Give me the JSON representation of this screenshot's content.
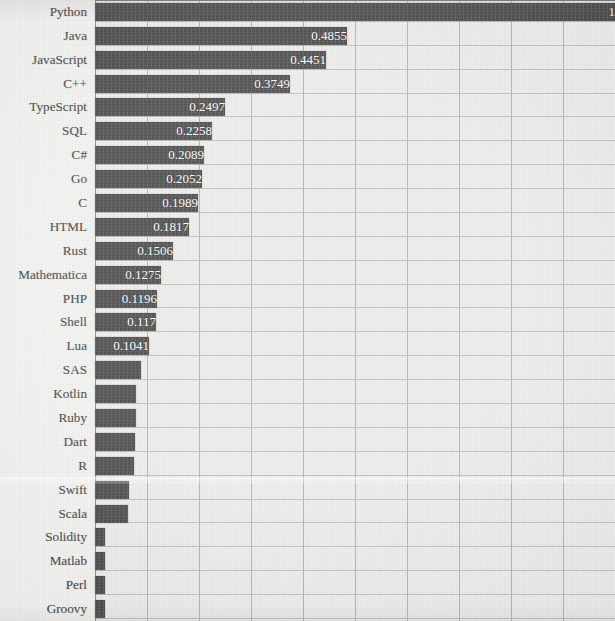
{
  "chart_data": {
    "type": "bar",
    "orientation": "horizontal",
    "title": "",
    "subtitle": "",
    "xlabel": "",
    "ylabel": "",
    "xlim": [
      0,
      1
    ],
    "grid": "vertical-and-horizontal",
    "legend": "none",
    "gridline_count": 10,
    "categories": [
      "Python",
      "Java",
      "JavaScript",
      "C++",
      "TypeScript",
      "SQL",
      "C#",
      "Go",
      "C",
      "HTML",
      "Rust",
      "Mathematica",
      "PHP",
      "Shell",
      "Lua",
      "SAS",
      "Kotlin",
      "Ruby",
      "Dart",
      "R",
      "Swift",
      "Scala",
      "Solidity",
      "Matlab",
      "Perl",
      "Groovy"
    ],
    "values": [
      1,
      0.4855,
      0.4451,
      0.3749,
      0.2497,
      0.2258,
      0.2089,
      0.2052,
      0.1989,
      0.1817,
      0.1506,
      0.1275,
      0.1196,
      0.117,
      0.1041,
      0.088,
      0.078,
      0.078,
      0.077,
      0.075,
      0.066,
      0.064,
      0.019,
      0.019,
      0.019,
      0.019
    ],
    "labels": [
      "1",
      "0.4855",
      "0.4451",
      "0.3749",
      "0.2497",
      "0.2258",
      "0.2089",
      "0.2052",
      "0.1989",
      "0.1817",
      "0.1506",
      "0.1275",
      "0.1196",
      "0.117",
      "0.1041",
      "",
      "",
      "",
      "",
      "",
      "",
      "",
      "",
      "",
      "",
      ""
    ],
    "colors": {
      "bar": "#201f1f",
      "bar_label": "#fdfdfd",
      "plot_background": "#e7e7e5",
      "page_background": "#eeeeec",
      "gridline": "#9d9d9d",
      "axis": "#6f6f6f",
      "category_label": "#1b1b1b"
    }
  }
}
